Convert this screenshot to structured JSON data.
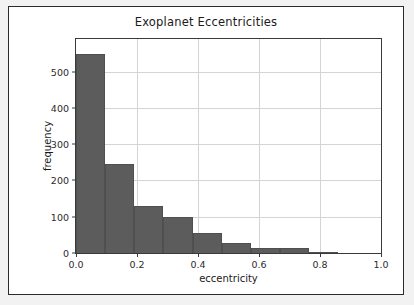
{
  "figure": {
    "background": "#ffffff",
    "page_background": "#f2f2f2",
    "border_color": "#2b2b2b"
  },
  "chart_data": {
    "type": "bar",
    "subtype": "histogram",
    "title": "Exoplanet Eccentricities",
    "xlabel": "eccentricity",
    "ylabel": "frequency",
    "bar_color": "#5c5c5c",
    "grid": true,
    "legend": null,
    "xlim": [
      0.0,
      1.0
    ],
    "ylim": [
      0,
      590
    ],
    "xticks": [
      0.0,
      0.2,
      0.4,
      0.6,
      0.8,
      1.0
    ],
    "xtick_labels": [
      "0.0",
      "0.2",
      "0.4",
      "0.6",
      "0.8",
      "1.0"
    ],
    "yticks": [
      0,
      100,
      200,
      300,
      400,
      500
    ],
    "ytick_labels": [
      "0",
      "100",
      "200",
      "300",
      "400",
      "500"
    ],
    "bin_edges": [
      0.0,
      0.0956,
      0.1911,
      0.2867,
      0.3822,
      0.4778,
      0.5733,
      0.6689,
      0.7644,
      0.86
    ],
    "categories": [
      "0.00-0.10",
      "0.10-0.19",
      "0.19-0.29",
      "0.29-0.38",
      "0.38-0.48",
      "0.48-0.57",
      "0.57-0.67",
      "0.67-0.76",
      "0.76-0.86"
    ],
    "values": [
      550,
      245,
      130,
      100,
      55,
      28,
      15,
      15,
      2
    ]
  }
}
